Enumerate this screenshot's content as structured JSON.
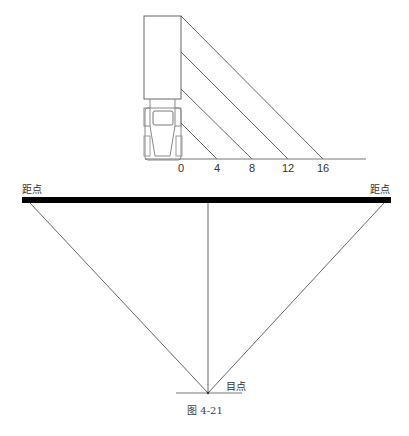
{
  "top_view": {
    "ground_ticks": [
      "0",
      "4",
      "8",
      "12",
      "16"
    ]
  },
  "perspective": {
    "left_label": "距点",
    "right_label": "距点",
    "eye_label": "目点"
  },
  "caption": "图 4-21",
  "colors": {
    "line": "#555555",
    "bar": "#000000",
    "text": "#333333"
  }
}
